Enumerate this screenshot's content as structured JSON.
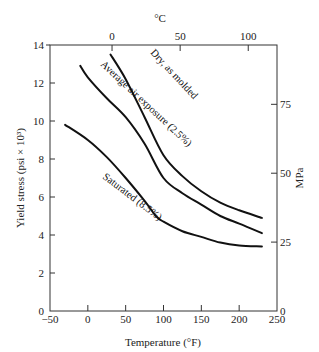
{
  "chart_data": {
    "type": "line",
    "title": "",
    "xlabel": "Temperature (°F)",
    "ylabel": "Yield stress (psi × 10³)",
    "x2label": "°C",
    "y2label": "MPa",
    "xlim": [
      -50,
      250
    ],
    "ylim": [
      0,
      14
    ],
    "x_ticks": [
      -50,
      0,
      50,
      100,
      150,
      200,
      250
    ],
    "y_ticks": [
      0,
      2,
      4,
      6,
      8,
      10,
      12,
      14
    ],
    "x2_ticks": [
      0,
      50,
      100
    ],
    "y2_ticks": [
      0,
      25,
      50,
      75
    ],
    "grid": false,
    "legend": "inline curve labels",
    "series": [
      {
        "name": "Dry, as molded",
        "x": [
          30,
          50,
          75,
          100,
          125,
          150,
          175,
          200,
          230
        ],
        "values": [
          13.5,
          12.2,
          10.2,
          8.2,
          7.1,
          6.3,
          5.7,
          5.3,
          4.9
        ]
      },
      {
        "name": "Average air exposure (2.5%)",
        "x": [
          -10,
          0,
          25,
          50,
          75,
          100,
          125,
          150,
          175,
          200,
          230
        ],
        "values": [
          12.9,
          12.3,
          11.2,
          10.2,
          8.8,
          7.0,
          6.2,
          5.6,
          5.0,
          4.6,
          4.1
        ]
      },
      {
        "name": "Saturated (8.5%)",
        "x": [
          -30,
          0,
          25,
          50,
          75,
          90,
          100,
          125,
          150,
          175,
          200,
          230
        ],
        "values": [
          9.8,
          9.0,
          8.1,
          7.0,
          5.8,
          5.0,
          4.7,
          4.2,
          3.9,
          3.6,
          3.45,
          3.4
        ]
      }
    ]
  }
}
